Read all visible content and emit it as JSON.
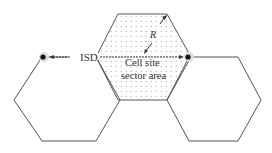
{
  "diagram": {
    "labels": {
      "isd": "ISD",
      "radius": "R",
      "sector_line1": "Cell site",
      "sector_line2": "sector area"
    },
    "colors": {
      "stroke": "#555555",
      "dot_fill": "#999999",
      "site_dot": "#111111"
    }
  }
}
